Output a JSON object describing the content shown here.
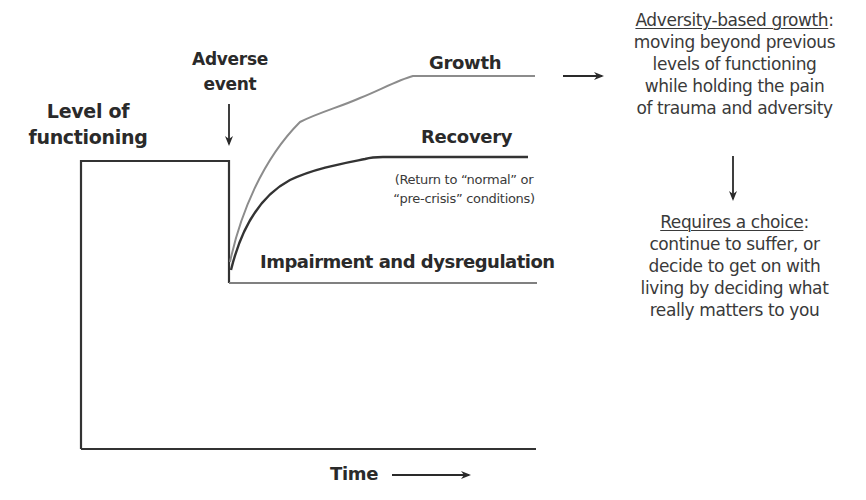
{
  "diagram": {
    "y_axis_label": "Level of functioning",
    "y_axis_label_lines": [
      "Level of",
      "functioning"
    ],
    "x_axis_label": "Time",
    "event_label_lines": [
      "Adverse",
      "event"
    ],
    "curves": {
      "growth": {
        "label": "Growth",
        "color": "#8c8c8c"
      },
      "recovery": {
        "label": "Recovery",
        "color": "#333333",
        "note_lines": [
          "(Return to “normal” or",
          "“pre-crisis” conditions)"
        ]
      },
      "impairment": {
        "label": "Impairment and dysregulation",
        "color": "#808080"
      }
    },
    "growth_panel": {
      "title": "Adversity-based growth",
      "title_suffix": ":",
      "lines": [
        "moving beyond previous",
        "levels of functioning",
        "while holding the pain",
        "of trauma and adversity"
      ]
    },
    "choice_panel": {
      "title": "Requires a choice",
      "title_suffix": ":",
      "lines": [
        "continue to suffer, or",
        "decide to get on with",
        "living by deciding what",
        "really matters to you"
      ]
    },
    "colors": {
      "axis": "#333333",
      "text": "#2a2a2a",
      "growth_line": "#8c8c8c",
      "recovery_line": "#333333",
      "impairment_line": "#808080"
    }
  }
}
